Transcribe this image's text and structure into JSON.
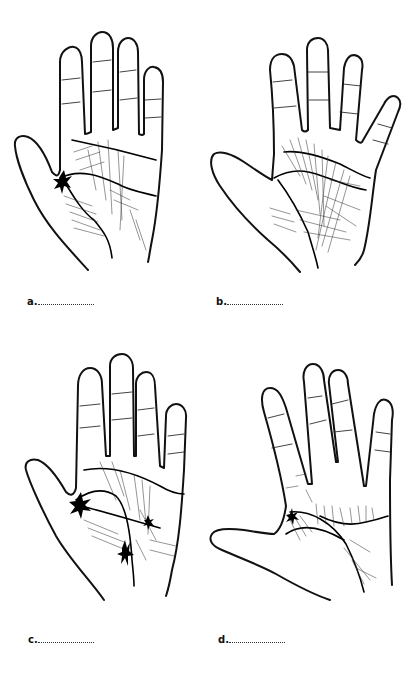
{
  "figure": {
    "panels": [
      {
        "id": "a",
        "label": "a.",
        "blank": "......................",
        "description": "Palm drawing with dense crossing lines and a dark blot at thumb base"
      },
      {
        "id": "b",
        "label": "b.",
        "blank": "......................",
        "description": "Palm drawing with widely spread fingers and many criss-crossing lines"
      },
      {
        "id": "c",
        "label": "c.",
        "blank": "......................",
        "description": "Palm drawing with star-like blots at thumb base and center"
      },
      {
        "id": "d",
        "label": "d.",
        "blank": "......................",
        "description": "Palm drawing with thumb extended horizontally and a curved heart line"
      }
    ],
    "colors": {
      "ink": "#111111",
      "background": "#ffffff"
    }
  }
}
